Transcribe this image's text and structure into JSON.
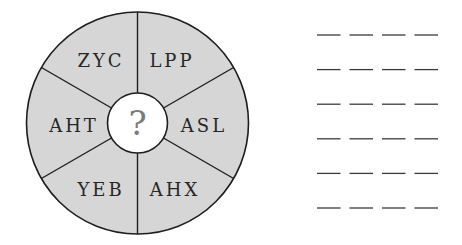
{
  "wheel": {
    "center": [
      137.5,
      123
    ],
    "outer_radius": 111,
    "inner_radius": 30,
    "fill_color": "#d6d6d6",
    "stroke_color": "#1e1e1e",
    "center_fill": "#ffffff",
    "center_symbol": "?",
    "segments": [
      {
        "label": "ZYC",
        "position": "upper-left"
      },
      {
        "label": "LPP",
        "position": "upper-right"
      },
      {
        "label": "ASL",
        "position": "right"
      },
      {
        "label": "AHX",
        "position": "lower-right"
      },
      {
        "label": "YEB",
        "position": "lower-left"
      },
      {
        "label": "AHT",
        "position": "left"
      }
    ]
  },
  "answer_blanks": {
    "rows": 6,
    "blanks_per_row": 4,
    "color": "#3a3a3a"
  }
}
